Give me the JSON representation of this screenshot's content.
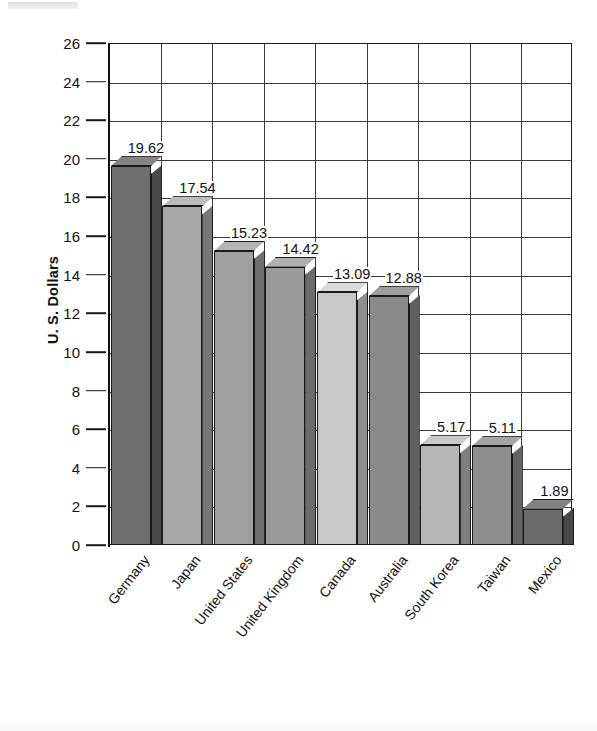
{
  "chart_data": {
    "type": "bar",
    "title": "",
    "subtitle": "",
    "xlabel": "",
    "ylabel": "U. S. Dollars",
    "ylim": [
      0,
      26
    ],
    "ytick_step": 2,
    "yticks": [
      26,
      24,
      22,
      20,
      18,
      16,
      14,
      12,
      10,
      8,
      6,
      4,
      2,
      0
    ],
    "grid": "both",
    "legend": "none",
    "value_labels_shown": true,
    "categories": [
      "Germany",
      "Japan",
      "United States",
      "United Kingdom",
      "Canada",
      "Australia",
      "South Korea",
      "Taiwan",
      "Mexico"
    ],
    "values": [
      19.62,
      17.54,
      15.23,
      14.42,
      13.09,
      12.88,
      5.17,
      5.11,
      1.89
    ],
    "value_label_text": [
      "19.62",
      "17.54",
      "15.23",
      "14.42",
      "13.09",
      "12.88",
      "5.17",
      "5.11",
      "1.89"
    ],
    "bar_colors": [
      "#6e6e6e",
      "#a8a8a8",
      "#a0a0a0",
      "#9a9a9a",
      "#c8c8c8",
      "#8a8a8a",
      "#b6b6b6",
      "#8f8f8f",
      "#6b6b6b"
    ],
    "bar_side_colors": [
      "#4a4a4a",
      "#777777",
      "#707070",
      "#6c6c6c",
      "#8e8e8e",
      "#606060",
      "#808080",
      "#646464",
      "#484848"
    ],
    "bar_top_colors": [
      "#848484",
      "#bcbcbc",
      "#b5b5b5",
      "#b0b0b0",
      "#dadada",
      "#9e9e9e",
      "#c9c9c9",
      "#a4a4a4",
      "#818181"
    ],
    "style": "3d-column",
    "axis_color": "#1c1c1c",
    "grid_color": "#3a3a3a",
    "background": "#ffffff"
  }
}
